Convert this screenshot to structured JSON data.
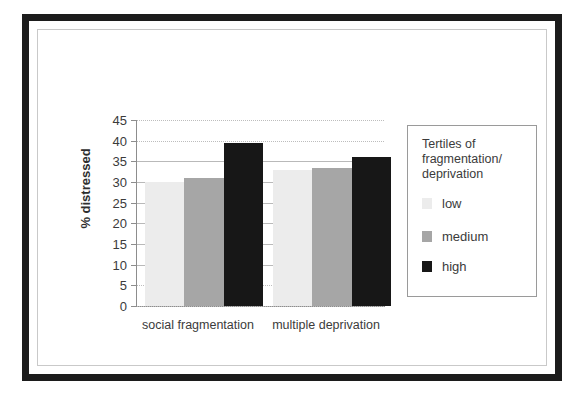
{
  "figure": {
    "frame_color": "#1c1c1c",
    "inner_frame_color": "#c9c9c9",
    "background": "#ffffff"
  },
  "legend": {
    "title": "Tertiles of fragmentation/ deprivation",
    "position": "right",
    "entries": [
      {
        "label": "low",
        "color": "#ececec"
      },
      {
        "label": "medium",
        "color": "#a6a6a6"
      },
      {
        "label": "high",
        "color": "#171717"
      }
    ]
  },
  "axis": {
    "y_title": "% distressed",
    "y_ticks": [
      "45",
      "40",
      "35",
      "30",
      "25",
      "20",
      "15",
      "10",
      "5",
      "0"
    ]
  },
  "chart_data": {
    "type": "bar",
    "title": "",
    "xlabel": "",
    "ylabel": "% distressed",
    "categories": [
      "social fragmentation",
      "multiple deprivation"
    ],
    "series": [
      {
        "name": "low",
        "color": "#ececec",
        "values": [
          30,
          33
        ]
      },
      {
        "name": "medium",
        "color": "#a6a6a6",
        "values": [
          31,
          33.5
        ]
      },
      {
        "name": "high",
        "color": "#171717",
        "values": [
          39.5,
          36
        ]
      }
    ],
    "ylim": [
      0,
      45
    ],
    "ytick_step": 5,
    "grid": true,
    "legend_position": "right",
    "legend_title": "Tertiles of fragmentation/ deprivation"
  }
}
